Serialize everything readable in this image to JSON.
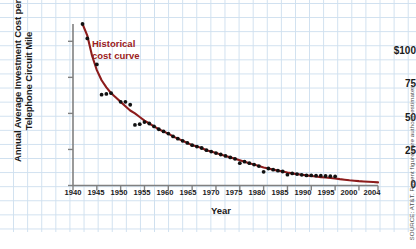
{
  "chart_data": {
    "type": "scatter",
    "title": "",
    "xlabel": "Year",
    "ylabel": "Annual Average Investment Cost per Telephone Circuit Mile",
    "xlim": [
      1940,
      2004
    ],
    "ylim": [
      0,
      112
    ],
    "grid": true,
    "grid_style": "graph-paper",
    "legend": "none",
    "annotations": [
      {
        "text_line1": "Historical",
        "text_line2": "cost curve",
        "color": "#9b2020",
        "x": 1948,
        "y": 88
      }
    ],
    "xticks": [
      1940,
      1945,
      1950,
      1955,
      1960,
      1965,
      1970,
      1975,
      1980,
      1985,
      1990,
      1995,
      2000,
      2004
    ],
    "xtick_labels": [
      "1940",
      "1945",
      "1950",
      "1955",
      "1960",
      "1965",
      "1970",
      "1975",
      "1980",
      "1985",
      "1990",
      "1995",
      "2000",
      "2004"
    ],
    "yticks": [
      0,
      25,
      50,
      75,
      100
    ],
    "ytick_labels": [
      "0",
      "25",
      "50",
      "75",
      "$100"
    ],
    "series": [
      {
        "name": "Historical cost curve",
        "type": "line",
        "color": "#8c1c1c",
        "x": [
          1942,
          1943,
          1944,
          1945,
          1946,
          1947,
          1948,
          1949,
          1950,
          1951,
          1952,
          1953,
          1954,
          1955,
          1956,
          1957,
          1958,
          1959,
          1960,
          1961,
          1962,
          1963,
          1964,
          1965,
          1966,
          1967,
          1968,
          1969,
          1970,
          1971,
          1972,
          1973,
          1974,
          1975,
          1976,
          1977,
          1978,
          1979,
          1980,
          1981,
          1982,
          1983,
          1984,
          1985,
          1986,
          1987,
          1988,
          1989,
          1990,
          1991,
          1992,
          1993,
          1994,
          1995,
          1996,
          1997,
          1998,
          1999,
          2000,
          2001,
          2002,
          2003,
          2004
        ],
        "y": [
          112,
          104,
          90,
          80,
          73,
          68,
          64,
          61,
          58,
          55,
          52,
          50,
          47.5,
          45,
          43,
          41,
          39,
          37.5,
          36,
          34,
          32.5,
          31,
          29.5,
          28,
          27,
          26,
          24.5,
          23.5,
          22.5,
          21.5,
          20.5,
          19.5,
          18.5,
          17.5,
          16.5,
          15.5,
          14.5,
          13.5,
          12.5,
          11.8,
          11,
          10.3,
          9.7,
          9,
          8.4,
          7.9,
          7.4,
          7,
          6.6,
          6.2,
          5.8,
          5.5,
          5.2,
          4.9,
          4.4,
          4,
          3.6,
          3.3,
          3,
          2.8,
          2.6,
          2.4,
          2.2
        ]
      },
      {
        "name": "Observed data points",
        "type": "scatter",
        "color": "#111111",
        "x": [
          1942,
          1943,
          1945,
          1946,
          1947,
          1948,
          1950,
          1951,
          1952,
          1953,
          1954,
          1955,
          1956,
          1957,
          1958,
          1959,
          1960,
          1961,
          1962,
          1963,
          1964,
          1965,
          1966,
          1967,
          1968,
          1969,
          1970,
          1971,
          1972,
          1973,
          1974,
          1975,
          1976,
          1977,
          1978,
          1979,
          1980,
          1981,
          1982,
          1983,
          1984,
          1985,
          1986,
          1987,
          1988,
          1989,
          1990,
          1991,
          1992,
          1993,
          1994,
          1995
        ],
        "y": [
          112,
          102,
          84,
          63,
          63.5,
          64,
          58,
          58,
          56,
          42,
          42.5,
          44,
          43,
          41,
          39,
          37.5,
          36,
          34,
          32.5,
          31,
          29.5,
          28,
          27,
          26,
          24.5,
          23.5,
          22.5,
          21.5,
          20.5,
          19.5,
          18.5,
          15.5,
          16.5,
          15.5,
          14.5,
          13.5,
          9.5,
          11.8,
          11,
          10.3,
          9.7,
          7.5,
          8.4,
          7.9,
          7.4,
          7,
          7,
          6.8,
          6.8,
          6.6,
          6.5,
          6.3
        ]
      }
    ]
  },
  "source": {
    "text": "SOURCE: AT&T. Recent figures are authors' estimates."
  },
  "axis": {
    "year_label": "Year"
  },
  "colors": {
    "curve": "#8c1c1c",
    "points": "#111111",
    "annotation": "#9b2020",
    "grid": "#cfe0ef",
    "axis": "#808080"
  }
}
